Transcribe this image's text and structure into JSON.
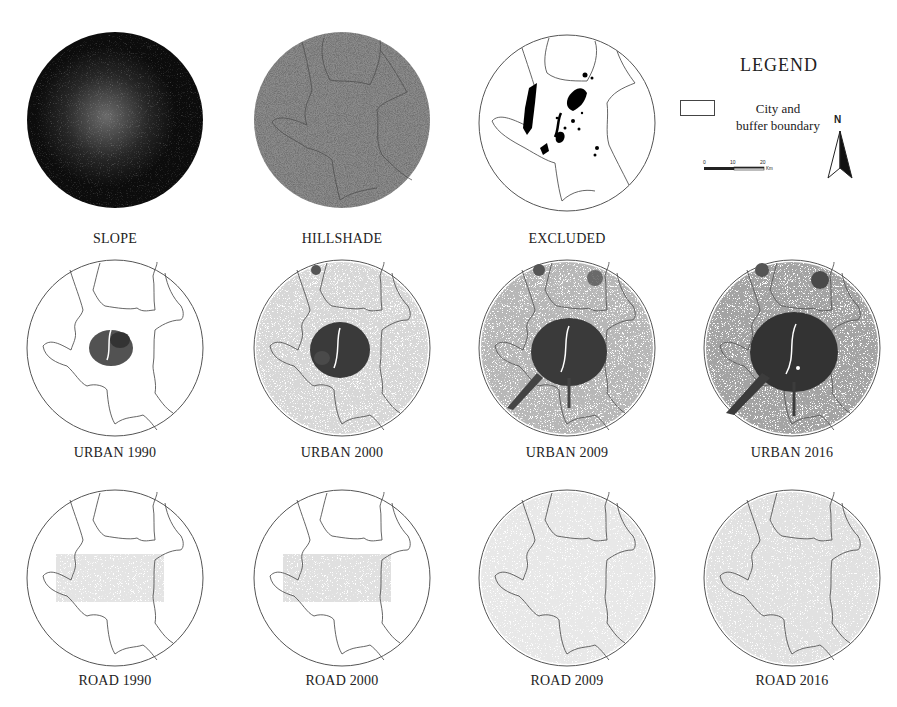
{
  "figure": {
    "panels": [
      {
        "id": "slope",
        "caption": "SLOPE",
        "style": "dark-raster"
      },
      {
        "id": "hillshade",
        "caption": "HILLSHADE",
        "style": "grey-raster"
      },
      {
        "id": "excluded",
        "caption": "EXCLUDED",
        "style": "excluded"
      },
      {
        "id": "urban-1990",
        "caption": "URBAN 1990",
        "style": "urban",
        "intensity": 0.35
      },
      {
        "id": "urban-2000",
        "caption": "URBAN 2000",
        "style": "urban",
        "intensity": 0.55
      },
      {
        "id": "urban-2009",
        "caption": "URBAN 2009",
        "style": "urban",
        "intensity": 0.8
      },
      {
        "id": "urban-2016",
        "caption": "URBAN 2016",
        "style": "urban",
        "intensity": 1.0
      },
      {
        "id": "road-1990",
        "caption": "ROAD 1990",
        "style": "road"
      },
      {
        "id": "road-2000",
        "caption": "ROAD 2000",
        "style": "road"
      },
      {
        "id": "road-2009",
        "caption": "ROAD 2009",
        "style": "road"
      },
      {
        "id": "road-2016",
        "caption": "ROAD 2016",
        "style": "road"
      }
    ]
  },
  "legend": {
    "title": "LEGEND",
    "items": [
      {
        "symbol": "rectangle-outline",
        "label_line1": "City and",
        "label_line2": "buffer boundary"
      }
    ],
    "scale": {
      "ticks": [
        "0",
        "10",
        "20"
      ],
      "unit": "Km"
    },
    "north_arrow": {
      "label": "N"
    }
  },
  "colors": {
    "boundary": "#555555",
    "urban": "#3a3a3a",
    "slope_bg": "#0c0c0c",
    "hillshade_bg": "#8a8a8a",
    "excluded": "#000000"
  }
}
